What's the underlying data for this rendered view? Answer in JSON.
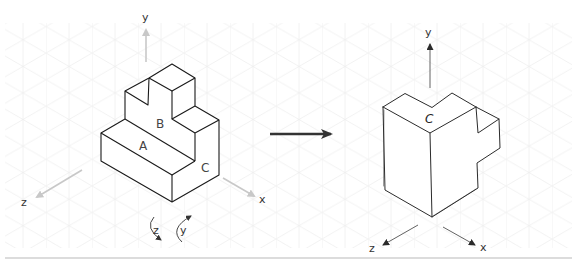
{
  "diagram": {
    "background_grid": "isometric",
    "colors": {
      "edge": "#1a1a1a",
      "light_axis": "#c8c8c8",
      "sketch": "#2b2b2b",
      "transform_arrow": "#333333",
      "grid": "#ececec",
      "divider": "#d0d0d0"
    },
    "left_view": {
      "axes": {
        "y": "y",
        "z": "z",
        "x": "x"
      },
      "faces": {
        "a": "A",
        "b": "B",
        "c": "C"
      },
      "rotations": [
        {
          "axis": "z",
          "label": "z",
          "icon": "rotate-arrow-icon"
        },
        {
          "axis": "y",
          "label": "y",
          "icon": "rotate-arrow-icon"
        }
      ]
    },
    "transform_arrow": {
      "icon": "right-arrow-icon"
    },
    "right_view": {
      "axes": {
        "y": "y",
        "z": "z",
        "x": "x"
      },
      "faces": {
        "c": "C"
      },
      "style": "hand-drawn sketch"
    }
  }
}
